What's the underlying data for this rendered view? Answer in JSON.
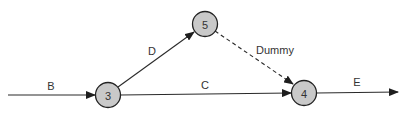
{
  "diagram": {
    "type": "activity-on-arrow network",
    "nodes": [
      {
        "id": "3",
        "label": "3",
        "cx": 108,
        "cy": 95
      },
      {
        "id": "5",
        "label": "5",
        "cx": 205,
        "cy": 24
      },
      {
        "id": "4",
        "label": "4",
        "cx": 304,
        "cy": 93
      }
    ],
    "edges": [
      {
        "id": "B",
        "label": "B",
        "from": "start",
        "to": "3",
        "style": "solid"
      },
      {
        "id": "D",
        "label": "D",
        "from": "3",
        "to": "5",
        "style": "solid"
      },
      {
        "id": "C",
        "label": "C",
        "from": "3",
        "to": "4",
        "style": "solid"
      },
      {
        "id": "Dummy",
        "label": "Dummy",
        "from": "5",
        "to": "4",
        "style": "dashed"
      },
      {
        "id": "E",
        "label": "E",
        "from": "4",
        "to": "end",
        "style": "solid"
      }
    ],
    "colors": {
      "node_fill": "#c9c9c9",
      "node_stroke": "#222222",
      "line": "#2a2a2a",
      "text": "#333333"
    }
  }
}
